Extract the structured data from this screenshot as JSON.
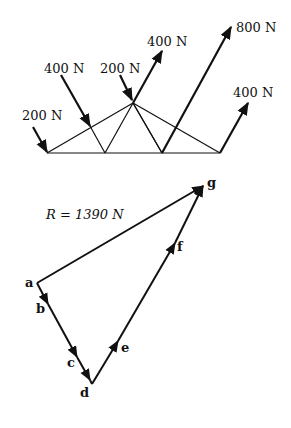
{
  "truss": {
    "loads": [
      {
        "label": "200 N",
        "from": [
          33,
          127
        ],
        "to": [
          47,
          153
        ],
        "lx": 22,
        "ly": 115
      },
      {
        "label": "400 N",
        "from": [
          61,
          75
        ],
        "to": [
          90,
          126
        ],
        "lx": 44,
        "ly": 68
      },
      {
        "label": "200 N",
        "from": [
          120,
          75
        ],
        "to": [
          133,
          101
        ],
        "lx": 100,
        "ly": 69
      },
      {
        "label": "400 N",
        "from": [
          133,
          103
        ],
        "to": [
          162,
          51
        ],
        "lx": 147,
        "ly": 45
      },
      {
        "label": "800 N",
        "from": [
          162,
          153
        ],
        "to": [
          231,
          27
        ],
        "lx": 236,
        "ly": 32
      },
      {
        "label": "400 N",
        "from": [
          220,
          153
        ],
        "to": [
          248,
          103
        ],
        "lx": 233,
        "ly": 96
      }
    ]
  },
  "polygon": {
    "resultant_label": "R = 1390 N",
    "points": {
      "a": "a",
      "b": "b",
      "c": "c",
      "d": "d",
      "e": "e",
      "f": "f",
      "g": "g"
    }
  }
}
